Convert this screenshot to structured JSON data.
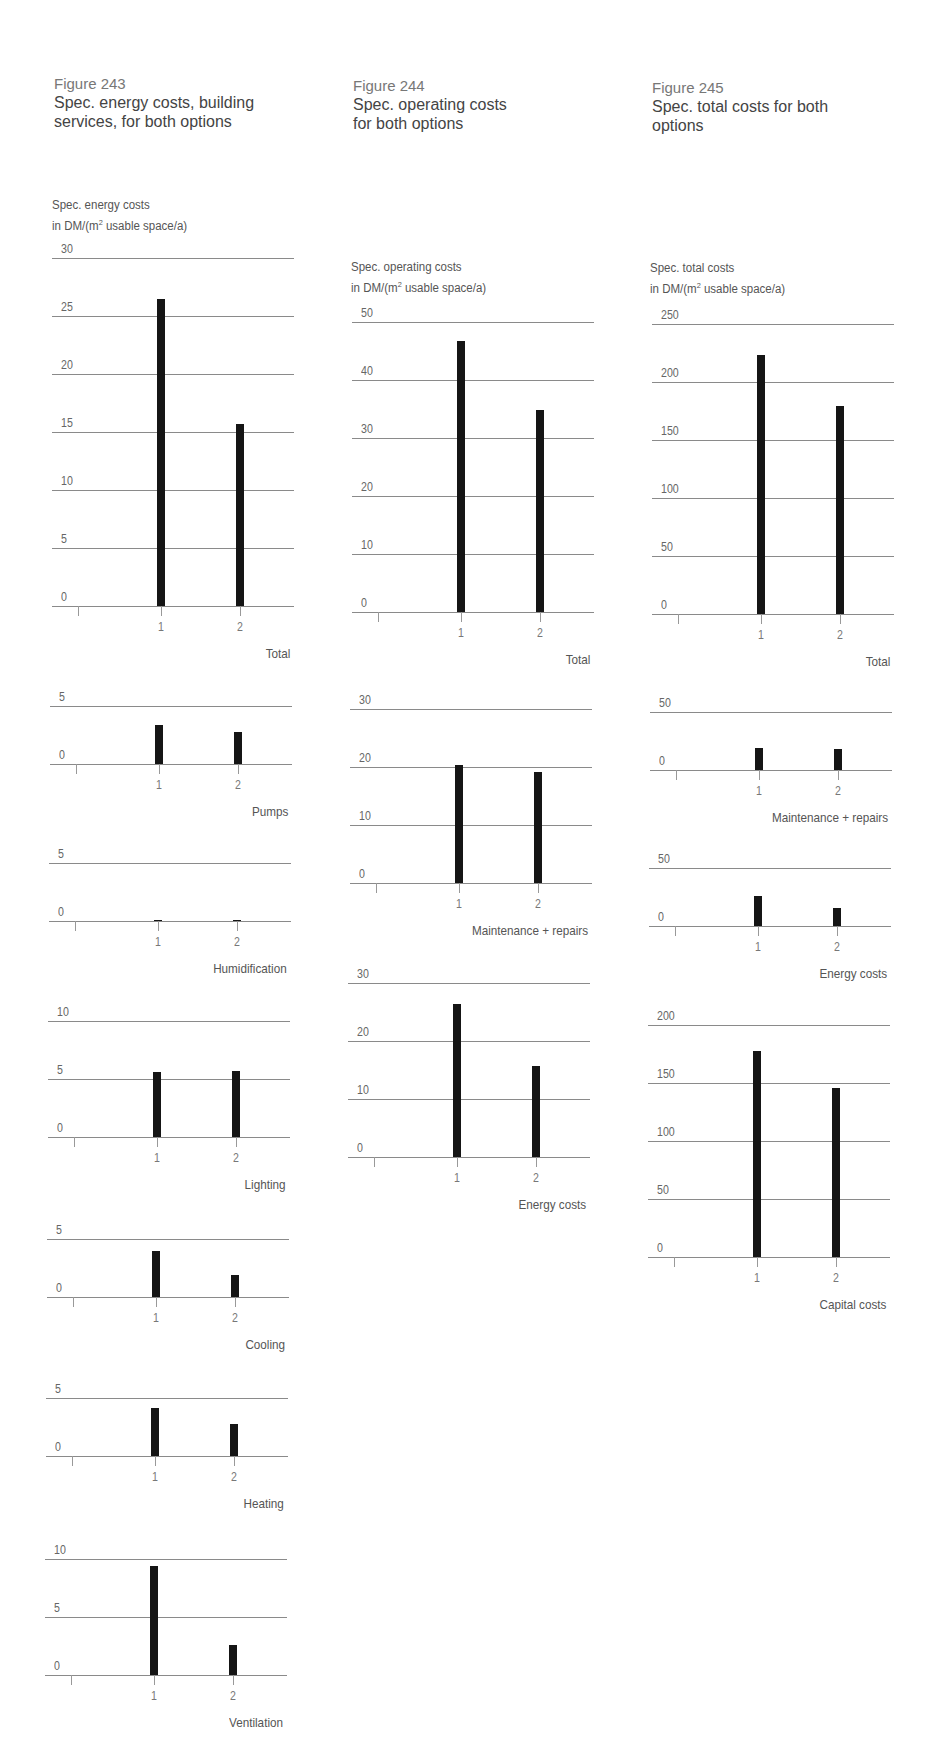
{
  "figures": [
    {
      "number": "Figure 243",
      "title_line1": "Spec. energy costs, building",
      "title_line2": "services, for both options",
      "unit_line1": "Spec. energy costs",
      "unit_line2_pre": "in DM/(m",
      "unit_sup": "2",
      "unit_line2_post": " usable space/a)"
    },
    {
      "number": "Figure 244",
      "title_line1": "Spec. operating costs",
      "title_line2": "for both options",
      "unit_line1": "Spec. operating costs",
      "unit_line2_pre": "in DM/(m",
      "unit_sup": "2",
      "unit_line2_post": " usable space/a)"
    },
    {
      "number": "Figure 245",
      "title_line1": "Spec. total costs for both",
      "title_line2": "options",
      "unit_line1": "Spec. total costs",
      "unit_line2_pre": "in DM/(m",
      "unit_sup": "2",
      "unit_line2_post": " usable space/a)"
    }
  ],
  "colors": {
    "bar": "#151515",
    "grid": "#8a8a8a",
    "text": "#555555"
  },
  "chart_data": [
    {
      "figure": "Figure 243",
      "type": "bar",
      "title": "Total",
      "categories": [
        "1",
        "2"
      ],
      "values": [
        26.5,
        15.7
      ],
      "yticks": [
        0,
        5,
        10,
        15,
        20,
        25,
        30
      ],
      "ylim": [
        0,
        30
      ],
      "ylabel": "Spec. energy costs in DM/(m2 usable space/a)",
      "xlabel": "Total"
    },
    {
      "figure": "Figure 243",
      "type": "bar",
      "title": "Pumps",
      "categories": [
        "1",
        "2"
      ],
      "values": [
        3.4,
        2.8
      ],
      "yticks": [
        0,
        5
      ],
      "ylim": [
        0,
        5
      ],
      "xlabel": "Pumps"
    },
    {
      "figure": "Figure 243",
      "type": "bar",
      "title": "Humidification",
      "categories": [
        "1",
        "2"
      ],
      "values": [
        0.1,
        0.1
      ],
      "yticks": [
        0,
        5
      ],
      "ylim": [
        0,
        5
      ],
      "xlabel": "Humidification"
    },
    {
      "figure": "Figure 243",
      "type": "bar",
      "title": "Lighting",
      "categories": [
        "1",
        "2"
      ],
      "values": [
        5.6,
        5.7
      ],
      "yticks": [
        0,
        5,
        10
      ],
      "ylim": [
        0,
        10
      ],
      "xlabel": "Lighting"
    },
    {
      "figure": "Figure 243",
      "type": "bar",
      "title": "Cooling",
      "categories": [
        "1",
        "2"
      ],
      "values": [
        4.0,
        1.9
      ],
      "yticks": [
        0,
        5
      ],
      "ylim": [
        0,
        5
      ],
      "xlabel": "Cooling"
    },
    {
      "figure": "Figure 243",
      "type": "bar",
      "title": "Heating",
      "categories": [
        "1",
        "2"
      ],
      "values": [
        4.1,
        2.8
      ],
      "yticks": [
        0,
        5
      ],
      "ylim": [
        0,
        5
      ],
      "xlabel": "Heating"
    },
    {
      "figure": "Figure 243",
      "type": "bar",
      "title": "Ventilation",
      "categories": [
        "1",
        "2"
      ],
      "values": [
        9.4,
        2.6
      ],
      "yticks": [
        0,
        5,
        10
      ],
      "ylim": [
        0,
        10
      ],
      "xlabel": "Ventilation"
    },
    {
      "figure": "Figure 244",
      "type": "bar",
      "title": "Total",
      "categories": [
        "1",
        "2"
      ],
      "values": [
        46.7,
        34.9
      ],
      "yticks": [
        0,
        10,
        20,
        30,
        40,
        50
      ],
      "ylim": [
        0,
        50
      ],
      "ylabel": "Spec. operating costs in DM/(m2 usable space/a)",
      "xlabel": "Total"
    },
    {
      "figure": "Figure 244",
      "type": "bar",
      "title": "Maintenance + repairs",
      "categories": [
        "1",
        "2"
      ],
      "values": [
        20.3,
        19.1
      ],
      "yticks": [
        0,
        10,
        20,
        30
      ],
      "ylim": [
        0,
        30
      ],
      "xlabel": "Maintenance + repairs"
    },
    {
      "figure": "Figure 244",
      "type": "bar",
      "title": "Energy costs",
      "categories": [
        "1",
        "2"
      ],
      "values": [
        26.3,
        15.7
      ],
      "yticks": [
        0,
        10,
        20,
        30
      ],
      "ylim": [
        0,
        30
      ],
      "xlabel": "Energy costs"
    },
    {
      "figure": "Figure 245",
      "type": "bar",
      "title": "Total",
      "categories": [
        "1",
        "2"
      ],
      "values": [
        223,
        179
      ],
      "yticks": [
        0,
        50,
        100,
        150,
        200,
        250
      ],
      "ylim": [
        0,
        250
      ],
      "ylabel": "Spec. total costs in DM/(m2 usable space/a)",
      "xlabel": "Total"
    },
    {
      "figure": "Figure 245",
      "type": "bar",
      "title": "Maintenance + repairs",
      "categories": [
        "1",
        "2"
      ],
      "values": [
        19.2,
        18.1
      ],
      "yticks": [
        0,
        50
      ],
      "ylim": [
        0,
        50
      ],
      "xlabel": "Maintenance + repairs"
    },
    {
      "figure": "Figure 245",
      "type": "bar",
      "title": "Energy costs",
      "categories": [
        "1",
        "2"
      ],
      "values": [
        26,
        15.5
      ],
      "yticks": [
        0,
        50
      ],
      "ylim": [
        0,
        50
      ],
      "xlabel": "Energy costs"
    },
    {
      "figure": "Figure 245",
      "type": "bar",
      "title": "Capital costs",
      "categories": [
        "1",
        "2"
      ],
      "values": [
        178,
        146
      ],
      "yticks": [
        0,
        50,
        100,
        150,
        200
      ],
      "ylim": [
        0,
        200
      ],
      "xlabel": "Capital costs"
    }
  ]
}
